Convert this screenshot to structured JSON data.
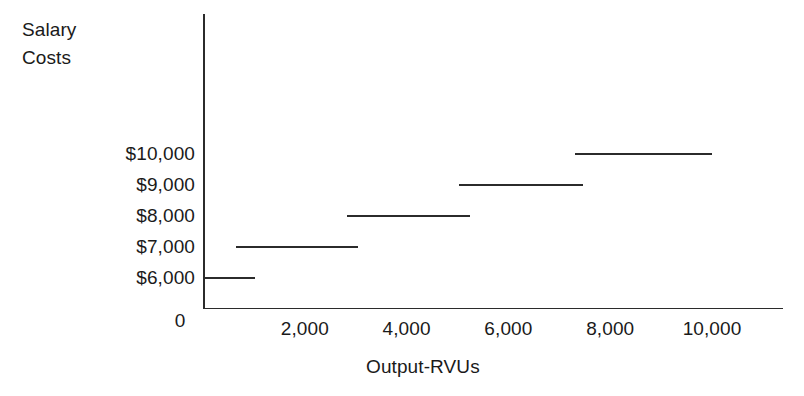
{
  "chart_data": {
    "type": "line",
    "subtype": "step-function",
    "title": "",
    "xlabel": "Output-RVUs",
    "ylabel": "Salary Costs",
    "ylabel_lines": [
      "Salary",
      "Costs"
    ],
    "grid": false,
    "legend": "none",
    "xlim": [
      0,
      11400
    ],
    "ylim": [
      5300,
      11500
    ],
    "x_tick_labels": [
      "2,000",
      "4,000",
      "6,000",
      "8,000",
      "10,000"
    ],
    "x_tick_values": [
      2000,
      4000,
      6000,
      8000,
      10000
    ],
    "x_origin_label": "0",
    "y_tick_labels": [
      "$10,000",
      "$9,000",
      "$8,000",
      "$7,000",
      "$6,000"
    ],
    "y_tick_values": [
      10000,
      9000,
      8000,
      7000,
      6000
    ],
    "line_color": "#2b2b2b",
    "axis_color": "#2b2b2b",
    "background_color": "#ffffff",
    "steps": [
      {
        "label": "$6,000",
        "value": 6000,
        "x_start": 0,
        "x_end": 1020
      },
      {
        "label": "$7,000",
        "value": 7000,
        "x_start": 650,
        "x_end": 3050
      },
      {
        "label": "$8,000",
        "value": 8000,
        "x_start": 2830,
        "x_end": 5250
      },
      {
        "label": "$9,000",
        "value": 9000,
        "x_start": 5030,
        "x_end": 7470
      },
      {
        "label": "$10,000",
        "value": 10000,
        "x_start": 7310,
        "x_end": 10000
      }
    ]
  }
}
